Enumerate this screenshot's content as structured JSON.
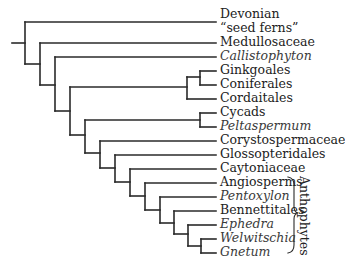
{
  "diagram": {
    "type": "cladogram",
    "line_color": "#2a2a2a",
    "taxa": [
      {
        "label": "Devonian",
        "y": 15,
        "italic": false
      },
      {
        "label": "“seed ferns”",
        "y": 29,
        "italic": false
      },
      {
        "label": "Medullosaceae",
        "y": 43,
        "italic": false
      },
      {
        "label": "Callistophyton",
        "y": 57,
        "italic": true
      },
      {
        "label": "Ginkgoales",
        "y": 71,
        "italic": false
      },
      {
        "label": "Coniferales",
        "y": 85,
        "italic": false
      },
      {
        "label": "Cordaitales",
        "y": 99,
        "italic": false
      },
      {
        "label": "Cycads",
        "y": 113,
        "italic": false
      },
      {
        "label": "Peltaspermum",
        "y": 127,
        "italic": true
      },
      {
        "label": "Corystospermaceae",
        "y": 141,
        "italic": false
      },
      {
        "label": "Glossopteridales",
        "y": 155,
        "italic": false
      },
      {
        "label": "Caytoniaceae",
        "y": 169,
        "italic": false
      },
      {
        "label": "Angiosperms",
        "y": 183,
        "italic": false
      },
      {
        "label": "Pentoxylon",
        "y": 197,
        "italic": true
      },
      {
        "label": "Bennettitales",
        "y": 211,
        "italic": false
      },
      {
        "label": "Ephedra",
        "y": 225,
        "italic": true
      },
      {
        "label": "Welwitschia",
        "y": 239,
        "italic": true
      },
      {
        "label": "Gnetum",
        "y": 253,
        "italic": true
      }
    ],
    "groups": [
      {
        "label": "Anthophytes",
        "brace": "right-curly-brace",
        "members": [
          "Angiosperms",
          "Pentoxylon",
          "Bennettitales",
          "Ephedra",
          "Welwitschia",
          "Gnetum"
        ]
      }
    ]
  }
}
